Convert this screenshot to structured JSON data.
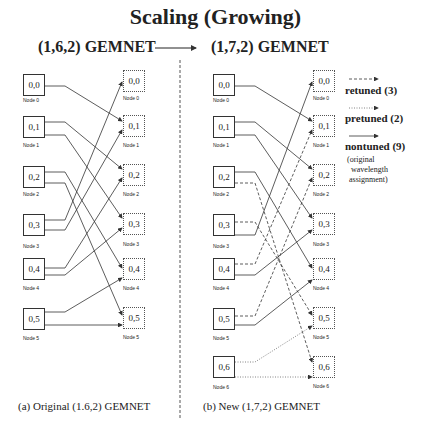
{
  "title": "Scaling (Growing)",
  "header": {
    "left": "(1,6,2) GEMNET",
    "right": "(1,7,2) GEMNET"
  },
  "left_diagram": {
    "caption": "(a) Original (1.6,2) GEMNET",
    "sources": [
      {
        "label": "0,0",
        "node": "Node 0"
      },
      {
        "label": "0,1",
        "node": "Node 1"
      },
      {
        "label": "0,2",
        "node": "Node 2"
      },
      {
        "label": "0,3",
        "node": "Node 3"
      },
      {
        "label": "0,4",
        "node": "Node 4"
      },
      {
        "label": "0,5",
        "node": "Node 5"
      }
    ],
    "destinations": [
      {
        "label": "0,0",
        "node": "Node 0"
      },
      {
        "label": "0,1",
        "node": "Node 1"
      },
      {
        "label": "0,2",
        "node": "Node 2"
      },
      {
        "label": "0,3",
        "node": "Node 3"
      },
      {
        "label": "0,4",
        "node": "Node 4"
      },
      {
        "label": "0,5",
        "node": "Node 5"
      }
    ]
  },
  "right_diagram": {
    "caption": "(b) New (1,7,2) GEMNET",
    "sources": [
      {
        "label": "0,0",
        "node": "Node 0"
      },
      {
        "label": "0,1",
        "node": "Node 1"
      },
      {
        "label": "0,2",
        "node": "Node 2"
      },
      {
        "label": "0,3",
        "node": "Node 3"
      },
      {
        "label": "0,4",
        "node": "Node 4"
      },
      {
        "label": "0,5",
        "node": "Node 5"
      },
      {
        "label": "0,6",
        "node": "Node 6"
      }
    ],
    "destinations": [
      {
        "label": "0,0",
        "node": "Node 0"
      },
      {
        "label": "0,1",
        "node": "Node 1"
      },
      {
        "label": "0,2",
        "node": "Node 2"
      },
      {
        "label": "0,3",
        "node": "Node 3"
      },
      {
        "label": "0,4",
        "node": "Node 4"
      },
      {
        "label": "0,5",
        "node": "Node 5"
      },
      {
        "label": "0,6",
        "node": "Node 6"
      }
    ]
  },
  "legend": {
    "retuned": "retuned (3)",
    "pretuned": "pretuned (2)",
    "nontuned": "nontuned (9)",
    "nontuned_note_1": "(original",
    "nontuned_note_2": "wavelength",
    "nontuned_note_3": "assignment)"
  }
}
